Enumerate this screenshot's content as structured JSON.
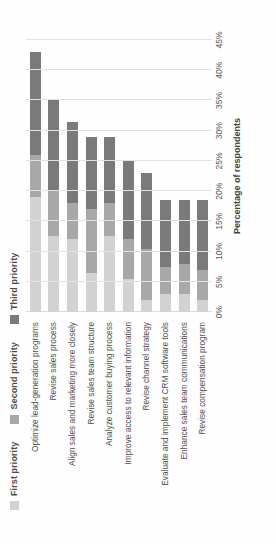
{
  "chart_data": {
    "type": "bar",
    "orientation": "horizontal-stacked",
    "title": "",
    "xlabel": "Percentage of respondents",
    "ylabel": "",
    "xlim": [
      0,
      45
    ],
    "xticks": [
      "0%",
      "5%",
      "10%",
      "15%",
      "20%",
      "25%",
      "30%",
      "35%",
      "40%",
      "45%"
    ],
    "xtick_values": [
      0,
      5,
      10,
      15,
      20,
      25,
      30,
      35,
      40,
      45
    ],
    "grid": true,
    "legend_position": "top-left",
    "categories": [
      "Optimize lead-generation programs",
      "Revise sales process",
      "Align sales and marketing more closely",
      "Revise sales team structure",
      "Analyze customer buying process",
      "Improve access to relevant information",
      "Revise channel strategy",
      "Evaluate and implement CRM software tools",
      "Enhance sales team communications",
      "Revise compensation program"
    ],
    "series": [
      {
        "name": "First priority",
        "color": "#d2d2d2",
        "values": [
          19.0,
          12.5,
          12.0,
          6.5,
          12.5,
          5.5,
          2.0,
          3.0,
          3.0,
          2.0
        ]
      },
      {
        "name": "Second priority",
        "color": "#a8a8a8",
        "values": [
          7.0,
          7.5,
          6.0,
          10.5,
          5.5,
          6.5,
          8.5,
          4.5,
          5.0,
          5.0
        ]
      },
      {
        "name": "Third priority",
        "color": "#7a7a7a",
        "values": [
          17.0,
          15.0,
          13.5,
          12.0,
          11.0,
          13.0,
          12.5,
          11.0,
          10.5,
          11.5
        ]
      }
    ],
    "totals": [
      43.0,
      35.0,
      31.5,
      29.0,
      29.0,
      25.0,
      23.0,
      18.5,
      18.5,
      18.5
    ]
  },
  "legend": {
    "items": [
      {
        "label": "First priority",
        "color": "#d2d2d2"
      },
      {
        "label": "Second priority",
        "color": "#a8a8a8"
      },
      {
        "label": "Third priority",
        "color": "#7a7a7a"
      }
    ]
  },
  "axis": {
    "x_title": "Percentage of respondents"
  }
}
